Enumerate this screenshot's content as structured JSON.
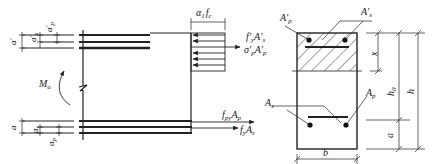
{
  "diagram": {
    "left_figure": {
      "moment": {
        "symbol": "M",
        "sub": "u"
      },
      "top_dims": [
        {
          "symbol": "a",
          "prime": "′",
          "sub": ""
        },
        {
          "symbol": "a",
          "prime": "′",
          "sub": "s"
        },
        {
          "symbol": "a",
          "prime": "′",
          "sub": "p"
        }
      ],
      "bottom_dims": [
        {
          "symbol": "a",
          "sub": ""
        },
        {
          "symbol": "a",
          "sub": "s"
        },
        {
          "symbol": "a",
          "sub": "p"
        }
      ],
      "stress_block": {
        "coef": "α",
        "coef_sub": "1",
        "f": "f",
        "f_sub": "c"
      },
      "forces_top": [
        {
          "label": "f′",
          "sub1": "y",
          "mid": "A′",
          "sub2": "s"
        },
        {
          "label": "σ′",
          "sub1": "p",
          "mid": "A′",
          "sub2": "p"
        }
      ],
      "forces_bottom": [
        {
          "label": "f",
          "sub1": "py",
          "mid": "A",
          "sub2": "p"
        },
        {
          "label": "f",
          "sub1": "y",
          "mid": "A",
          "sub2": "s"
        }
      ]
    },
    "right_figure": {
      "labels": {
        "Ap_prime": {
          "symbol": "A′",
          "sub": "p"
        },
        "As_prime": {
          "symbol": "A′",
          "sub": "s"
        },
        "As": {
          "symbol": "A",
          "sub": "s"
        },
        "Ap": {
          "symbol": "A",
          "sub": "p"
        },
        "x": "x",
        "h0": {
          "symbol": "h",
          "sub": "0"
        },
        "h": "h",
        "a": "a",
        "b": "b"
      }
    },
    "colors": {
      "line": "#222222",
      "hatch": "#333333",
      "background": "#ffffff"
    }
  }
}
